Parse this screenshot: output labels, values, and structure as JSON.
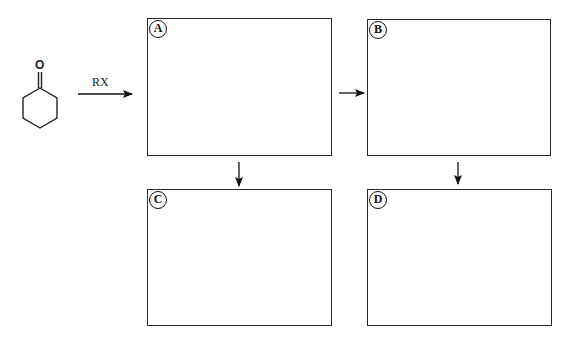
{
  "diagram": {
    "reactant": {
      "name": "cyclohexanone",
      "atom_label": "O"
    },
    "reagent_label": "RX",
    "boxes": [
      {
        "id": "A",
        "label": "A"
      },
      {
        "id": "B",
        "label": "B"
      },
      {
        "id": "C",
        "label": "C"
      },
      {
        "id": "D",
        "label": "D"
      }
    ],
    "arrows": [
      {
        "from": "cyclohexanone",
        "to": "A",
        "label": "RX"
      },
      {
        "from": "A",
        "to": "B"
      },
      {
        "from": "A",
        "to": "C"
      },
      {
        "from": "B",
        "to": "D"
      }
    ]
  }
}
